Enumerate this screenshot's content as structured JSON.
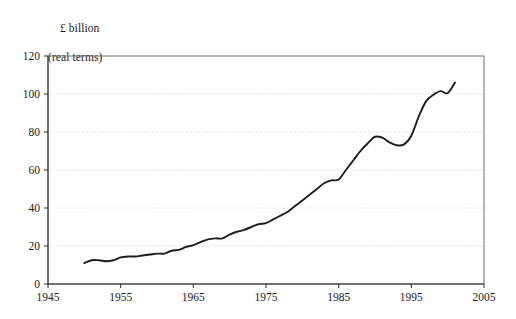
{
  "chart_data": {
    "type": "line",
    "title": "",
    "subtitle": "",
    "ylabel_line1": "£ billion",
    "ylabel_line2": "(real terms)",
    "xlabel": "",
    "grid": "horizontal-dotted",
    "legend": "none",
    "xlim": [
      1945,
      2005
    ],
    "ylim": [
      0,
      120
    ],
    "xticks": [
      1945,
      1955,
      1965,
      1975,
      1985,
      1995,
      2005
    ],
    "xtick_labels": [
      "1945",
      "1955",
      "1965",
      "1975",
      "1985",
      "1995",
      "2005"
    ],
    "yticks": [
      0,
      20,
      40,
      60,
      80,
      100,
      120
    ],
    "ytick_labels": [
      "0",
      "20",
      "40",
      "60",
      "80",
      "100",
      "120"
    ],
    "series": [
      {
        "name": "Spending",
        "color": "#1d1d1d",
        "x": [
          1950,
          1951,
          1952,
          1953,
          1954,
          1955,
          1956,
          1957,
          1958,
          1959,
          1960,
          1961,
          1962,
          1963,
          1964,
          1965,
          1966,
          1967,
          1968,
          1969,
          1970,
          1971,
          1972,
          1973,
          1974,
          1975,
          1976,
          1977,
          1978,
          1979,
          1980,
          1981,
          1982,
          1983,
          1984,
          1985,
          1986,
          1987,
          1988,
          1989,
          1990,
          1991,
          1992,
          1993,
          1994,
          1995,
          1996,
          1997,
          1998,
          1999,
          2000,
          2001
        ],
        "values": [
          11.0,
          12.5,
          12.5,
          12.0,
          12.5,
          14.0,
          14.5,
          14.5,
          15.0,
          15.5,
          16.0,
          16.0,
          17.5,
          18.0,
          19.5,
          20.5,
          22.0,
          23.5,
          24.0,
          24.0,
          26.0,
          27.5,
          28.5,
          30.0,
          31.5,
          32.0,
          34.0,
          36.0,
          38.0,
          41.0,
          44.0,
          47.0,
          50.0,
          53.0,
          54.5,
          55.0,
          60.0,
          65.0,
          70.0,
          74.0,
          77.5,
          77.0,
          74.5,
          73.0,
          73.5,
          78.0,
          88.0,
          96.0,
          99.5,
          101.5,
          100.5,
          106.0
        ]
      }
    ]
  },
  "axes": {
    "plot_left_px": 48,
    "plot_right_px": 484,
    "plot_top_px": 56,
    "plot_bottom_px": 284
  }
}
